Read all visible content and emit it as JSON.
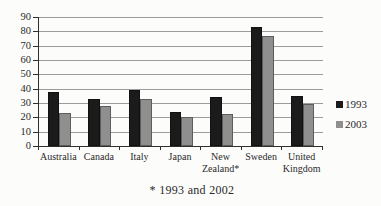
{
  "chart_data": {
    "type": "bar",
    "title": "",
    "categories": [
      "Australia",
      "Canada",
      "Italy",
      "Japan",
      "New Zealand*",
      "Sweden",
      "United Kingdom"
    ],
    "series": [
      {
        "name": "1993",
        "color": "#1b1b1b",
        "values": [
          38,
          33,
          39,
          24,
          34,
          83,
          35
        ]
      },
      {
        "name": "2003",
        "color": "#8f8f8f",
        "values": [
          23,
          28,
          33,
          20,
          22,
          77,
          29
        ]
      }
    ],
    "ylim": [
      0,
      90
    ],
    "ytick_step": 10,
    "yticks": [
      0,
      10,
      20,
      30,
      40,
      50,
      60,
      70,
      80,
      90
    ],
    "grid": true,
    "legend_position": "right",
    "footnote": "* 1993 and 2002"
  },
  "colors": {
    "background": "#fcfcfa",
    "gridline": "#9c9c9c",
    "axis": "#2f2f2f",
    "text": "#2a2a2a"
  }
}
